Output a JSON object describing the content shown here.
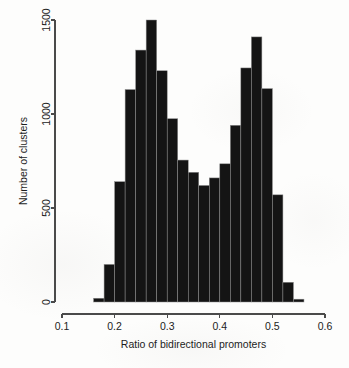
{
  "chart_data": {
    "type": "bar",
    "title": "",
    "subtitle": "",
    "xlabel": "Ratio of bidirectional promoters",
    "ylabel": "Number of clusters",
    "xlim": [
      0.1,
      0.6
    ],
    "ylim": [
      0,
      1500
    ],
    "grid": false,
    "legend": null,
    "xticks": [
      0.1,
      0.2,
      0.3,
      0.4,
      0.5,
      0.6
    ],
    "xtick_labels": [
      "0.1",
      "0.2",
      "0.3",
      "0.4",
      "0.5",
      "0.6"
    ],
    "yticks": [
      0,
      500,
      1000,
      1500
    ],
    "ytick_labels": [
      "0",
      "500",
      "1000",
      "1500"
    ],
    "bin_width": 0.02,
    "bin_starts": [
      0.16,
      0.18,
      0.2,
      0.22,
      0.24,
      0.26,
      0.28,
      0.3,
      0.32,
      0.34,
      0.36,
      0.38,
      0.4,
      0.42,
      0.44,
      0.46,
      0.48,
      0.5,
      0.52,
      0.54
    ],
    "categories": [
      "0.16-0.18",
      "0.18-0.20",
      "0.20-0.22",
      "0.22-0.24",
      "0.24-0.26",
      "0.26-0.28",
      "0.28-0.30",
      "0.30-0.32",
      "0.32-0.34",
      "0.34-0.36",
      "0.36-0.38",
      "0.38-0.40",
      "0.40-0.42",
      "0.42-0.44",
      "0.44-0.46",
      "0.46-0.48",
      "0.48-0.50",
      "0.50-0.52",
      "0.52-0.54",
      "0.54-0.56"
    ],
    "values": [
      20,
      200,
      640,
      1130,
      1340,
      1500,
      1230,
      975,
      755,
      690,
      620,
      660,
      735,
      940,
      1245,
      1410,
      1135,
      570,
      105,
      15
    ],
    "bar_color": "#141414",
    "bar_edge_color": "#8d8d8d",
    "axis_color": "#4a4a4a",
    "background_color": "#fdfdfc"
  },
  "geometry": {
    "plot_left_px": 62,
    "plot_right_px": 325,
    "plot_baseline_px": 302,
    "plot_top_px": 20
  }
}
